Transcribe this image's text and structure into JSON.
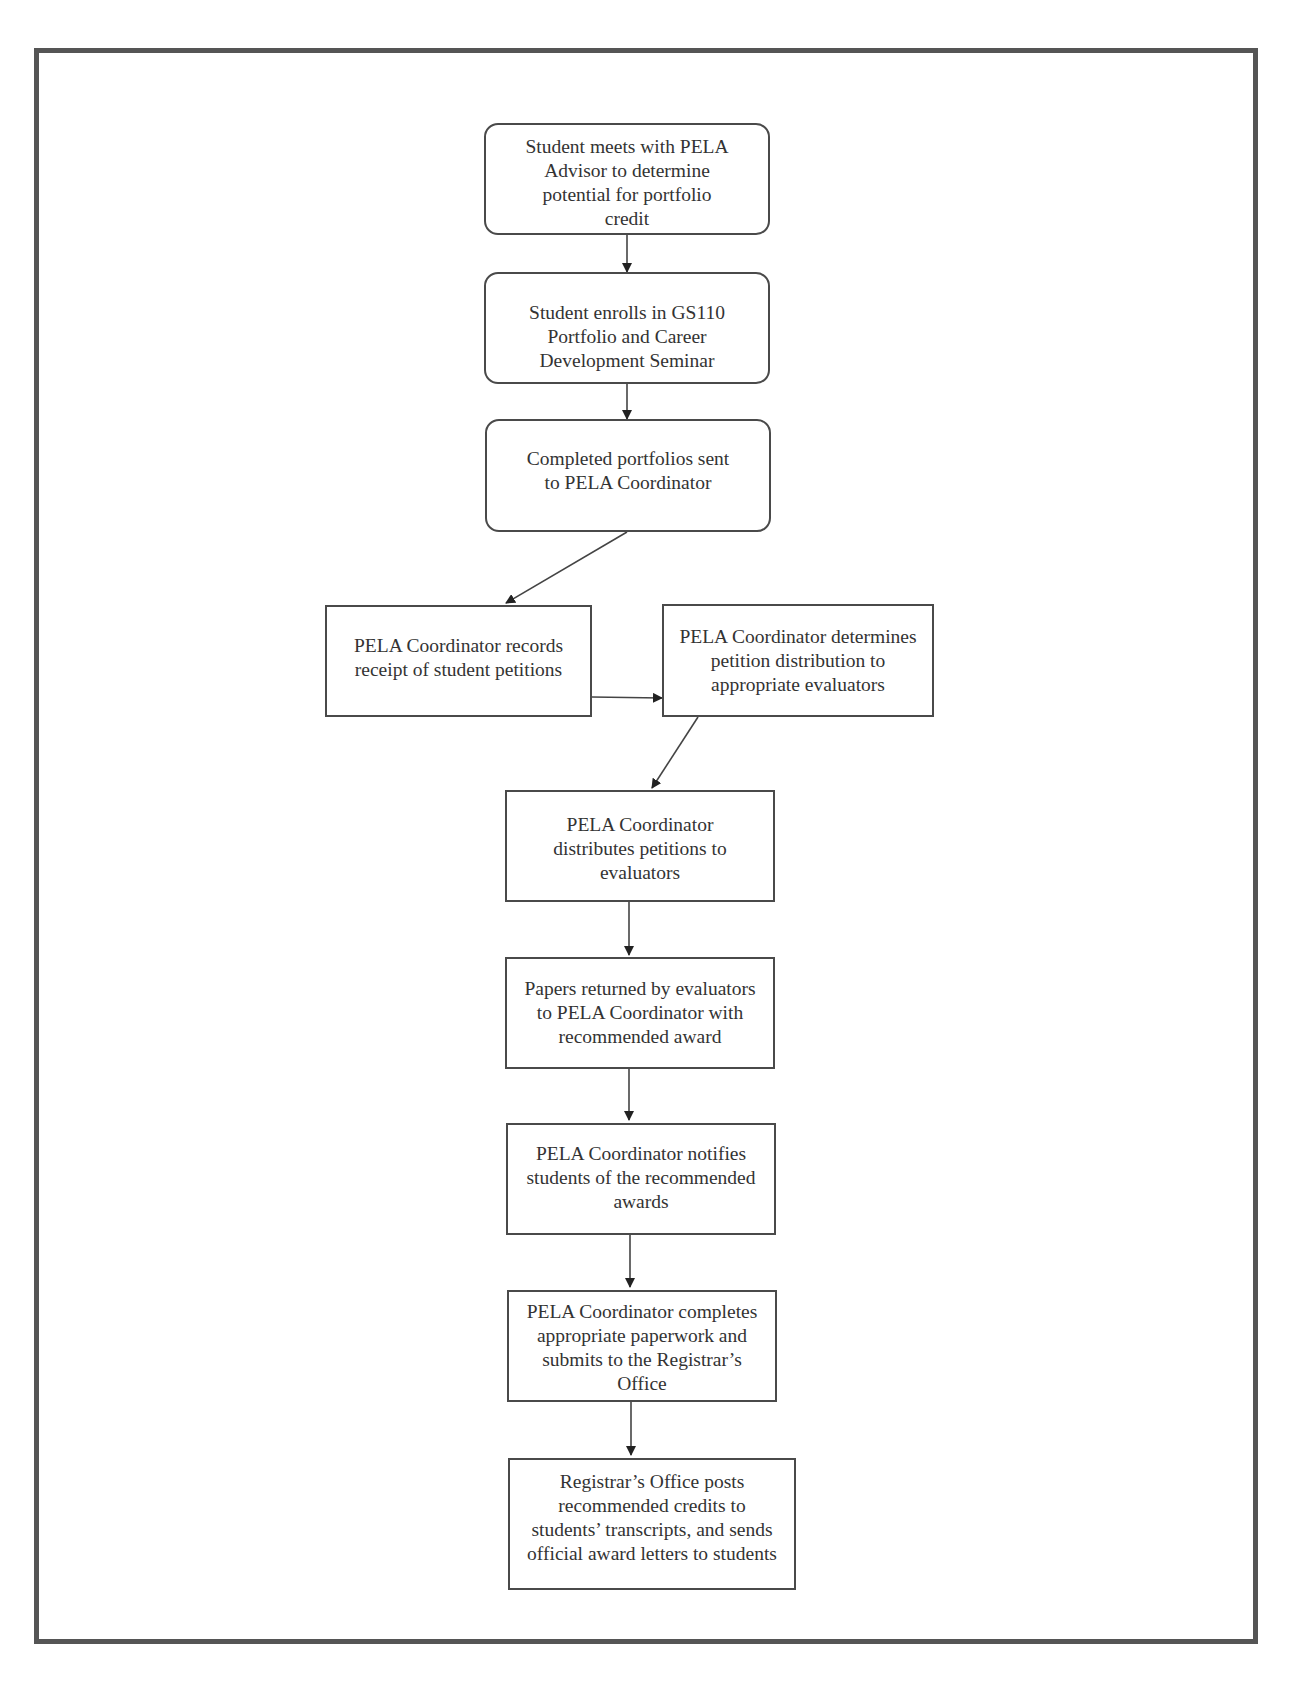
{
  "diagram": {
    "type": "flowchart",
    "nodes": [
      {
        "id": "n1",
        "shape": "rounded-rect",
        "text": "Student meets with PELA\nAdvisor to determine\npotential for portfolio\ncredit"
      },
      {
        "id": "n2",
        "shape": "rounded-rect",
        "text": "Student enrolls in GS110\nPortfolio and Career\nDevelopment Seminar"
      },
      {
        "id": "n3",
        "shape": "rounded-rect",
        "text": "Completed portfolios sent\nto PELA Coordinator"
      },
      {
        "id": "n4",
        "shape": "rect",
        "text": "PELA Coordinator records\nreceipt of student petitions"
      },
      {
        "id": "n5",
        "shape": "rect",
        "text": "PELA Coordinator determines\npetition distribution to\nappropriate evaluators"
      },
      {
        "id": "n6",
        "shape": "rect",
        "text": "PELA Coordinator\ndistributes petitions to\nevaluators"
      },
      {
        "id": "n7",
        "shape": "rect",
        "text": "Papers returned by evaluators\nto PELA Coordinator with\nrecommended award"
      },
      {
        "id": "n8",
        "shape": "rect",
        "text": "PELA Coordinator notifies\nstudents of the recommended\nawards"
      },
      {
        "id": "n9",
        "shape": "rect",
        "text": "PELA Coordinator completes\nappropriate paperwork and\nsubmits to the Registrar’s\nOffice"
      },
      {
        "id": "n10",
        "shape": "rect",
        "text": "Registrar’s Office posts\nrecommended credits to\nstudents’ transcripts, and sends\nofficial award letters to students"
      }
    ],
    "edges": [
      {
        "from": "n1",
        "to": "n2"
      },
      {
        "from": "n2",
        "to": "n3"
      },
      {
        "from": "n3",
        "to": "n4"
      },
      {
        "from": "n4",
        "to": "n5"
      },
      {
        "from": "n5",
        "to": "n6"
      },
      {
        "from": "n6",
        "to": "n7"
      },
      {
        "from": "n7",
        "to": "n8"
      },
      {
        "from": "n8",
        "to": "n9"
      },
      {
        "from": "n9",
        "to": "n10"
      }
    ],
    "colors": {
      "stroke": "#4a4a4a",
      "frame": "#555555",
      "text": "#333333",
      "background": "#ffffff"
    }
  }
}
